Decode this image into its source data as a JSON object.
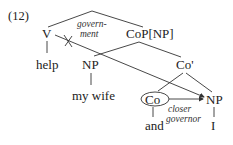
{
  "example_number": "(12)",
  "nodes": {
    "v": "V",
    "cop": "CoP[NP]",
    "np_object": "NP",
    "co_bar": "Co'",
    "co": "Co",
    "np_conjunct": "NP"
  },
  "leaves": {
    "help": "help",
    "my_wife": "my wife",
    "and": "and",
    "i": "I"
  },
  "annotations": {
    "government_line1": "govern-",
    "government_line2": "ment",
    "closer_line1": "closer",
    "closer_line2": "governor"
  },
  "marks": {
    "blocked": "crossed-out-arrow"
  }
}
